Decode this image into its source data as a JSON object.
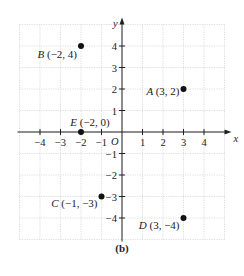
{
  "chart_data": {
    "type": "scatter",
    "title": "",
    "caption": "(b)",
    "xlabel": "x",
    "ylabel": "y",
    "origin_label": "O",
    "xlim": [
      -5,
      5
    ],
    "ylim": [
      -5,
      5
    ],
    "grid": true,
    "x_ticks": [
      -4,
      -3,
      -2,
      -1,
      1,
      2,
      3,
      4
    ],
    "y_ticks": [
      4,
      3,
      2,
      1,
      -1,
      -2,
      -3,
      -4
    ],
    "x_tick_labels": [
      "−4",
      "−3",
      "−2",
      "−1",
      "1",
      "2",
      "3",
      "4"
    ],
    "y_tick_labels": [
      "4",
      "3",
      "2",
      "1",
      "−1",
      "−2",
      "−3",
      "−4"
    ],
    "points": [
      {
        "name": "A",
        "x": 3,
        "y": 2,
        "label": "(3, 2)"
      },
      {
        "name": "B",
        "x": -2,
        "y": 4,
        "label": "(−2, 4)"
      },
      {
        "name": "C",
        "x": -1,
        "y": -3,
        "label": "(−1, −3)"
      },
      {
        "name": "D",
        "x": 3,
        "y": -4,
        "label": "(3, −4)"
      },
      {
        "name": "E",
        "x": -2,
        "y": 0,
        "label": "(−2, 0)"
      }
    ]
  }
}
